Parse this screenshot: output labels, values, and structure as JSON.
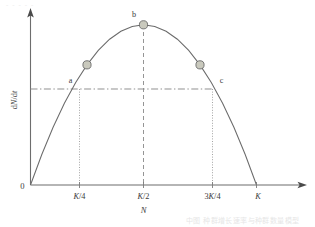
{
  "chart_data": {
    "type": "line",
    "title": "",
    "xlabel": "N",
    "ylabel": "dN/dt",
    "xlim": [
      0,
      1.1
    ],
    "ylim": [
      0,
      1.12
    ],
    "grid": false,
    "legend_position": "none",
    "curve_description": "Logistic growth rate parabola dN/dt = rN(1 - N/K), zero at N=0 and N=K, maximum at N=K/2",
    "x_tick_labels": [
      "K/4",
      "K/2",
      "3K/4",
      "K"
    ],
    "x_tick_values": [
      0.25,
      0.5,
      0.75,
      1.0
    ],
    "origin_label": "0",
    "series": [
      {
        "name": "dN/dt",
        "x": [
          0.0,
          0.05,
          0.1,
          0.15,
          0.2,
          0.25,
          0.3,
          0.35,
          0.4,
          0.45,
          0.5,
          0.55,
          0.6,
          0.65,
          0.7,
          0.75,
          0.8,
          0.85,
          0.9,
          0.95,
          1.0
        ],
        "values": [
          0.0,
          0.19,
          0.36,
          0.51,
          0.64,
          0.75,
          0.84,
          0.91,
          0.96,
          0.99,
          1.0,
          0.99,
          0.96,
          0.91,
          0.84,
          0.75,
          0.64,
          0.51,
          0.36,
          0.19,
          0.0
        ]
      }
    ],
    "annotations": [
      {
        "label": "a",
        "x": 0.25,
        "y": 0.75,
        "marker": "circle",
        "note": "rate equal to point c"
      },
      {
        "label": "b",
        "x": 0.5,
        "y": 1.0,
        "marker": "circle",
        "note": "maximum growth rate"
      },
      {
        "label": "c",
        "x": 0.75,
        "y": 0.75,
        "marker": "circle",
        "note": "rate equal to point a"
      }
    ],
    "reference_lines": [
      {
        "name": "equal-rate-line",
        "orientation": "horizontal",
        "y": 0.75,
        "style": "dash-dot"
      },
      {
        "name": "peak-line",
        "orientation": "vertical",
        "x": 0.5,
        "style": "dashed"
      },
      {
        "name": "a-dropline",
        "orientation": "vertical",
        "x": 0.25,
        "style": "dotted"
      },
      {
        "name": "c-dropline",
        "orientation": "vertical",
        "x": 0.75,
        "style": "dotted"
      }
    ]
  },
  "labels": {
    "point_a": "a",
    "point_b": "b",
    "point_c": "c",
    "origin": "0",
    "x_axis_name": "N",
    "y_axis_name_numer": "d",
    "y_axis_name_var1": "N",
    "y_axis_name_slash": "/d",
    "y_axis_name_var2": "t",
    "y_axis_full": "dN/dt",
    "tick_k4_num": "K",
    "tick_k4_den": "/4",
    "tick_k2_num": "K",
    "tick_k2_den": "/2",
    "tick_3k4_pre": "3",
    "tick_3k4_num": "K",
    "tick_3k4_den": "/4",
    "tick_k": "K"
  },
  "artifacts": {
    "top_scan_marks": "- - - - -",
    "bottom_caption": "中图 种群增长速率与种群数量模型"
  },
  "colors": {
    "curve": "#6b6b6b",
    "axis": "#6d6d6d",
    "marker_fill": "#c9c9bd",
    "marker_stroke": "#6a6a6a",
    "dashdot": "#8a8a8a",
    "dotted": "#9a9a9a",
    "text": "#3b3b3b",
    "background": "#ffffff"
  }
}
